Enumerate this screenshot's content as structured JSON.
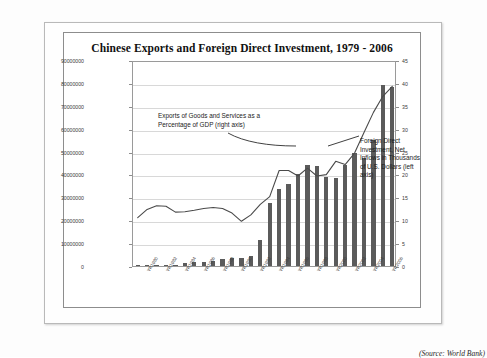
{
  "chart_data": {
    "type": "bar",
    "title": "Chinese Exports and Foreign Direct Investment, 1979 - 2006",
    "xlabel": "",
    "ylabel": "",
    "grid": true,
    "legend_position": "inline-annotations",
    "categories": [
      "YR1979",
      "YR1980",
      "YR1981",
      "YR1982",
      "YR1983",
      "YR1984",
      "YR1985",
      "YR1986",
      "YR1987",
      "YR1988",
      "YR1989",
      "YR1990",
      "YR1991",
      "YR1992",
      "YR1993",
      "YR1994",
      "YR1995",
      "YR1996",
      "YR1997",
      "YR1998",
      "YR1999",
      "YR2000",
      "YR2001",
      "YR2002",
      "YR2003",
      "YR2004",
      "YR2005",
      "YR2006"
    ],
    "xtick_labels": [
      "YR1980",
      "YR1982",
      "YR1984",
      "YR1986",
      "YR1988",
      "YR1990",
      "YR1992",
      "YR1994",
      "YR1996",
      "YR1998",
      "YR2000",
      "YR2002",
      "YR2004",
      "YR2006"
    ],
    "left_axis": {
      "label": "Foreign Direct Investment, Net Inflows in Thousands of U.S. Dollars",
      "ylim": [
        0,
        90000000
      ],
      "ticks": [
        0,
        10000000,
        20000000,
        30000000,
        40000000,
        50000000,
        60000000,
        70000000,
        80000000,
        90000000
      ],
      "tick_labels": [
        "0",
        "10000000",
        "20000000",
        "30000000",
        "40000000",
        "50000000",
        "60000000",
        "70000000",
        "80000000",
        "90000000"
      ]
    },
    "right_axis": {
      "label": "Exports of Goods and Services as a Percentage of GDP",
      "ylim": [
        0,
        45
      ],
      "ticks": [
        0,
        5,
        10,
        15,
        20,
        25,
        30,
        35,
        40,
        45
      ],
      "tick_labels": [
        "0",
        "5",
        "10",
        "15",
        "20",
        "25",
        "30",
        "35",
        "40",
        "45"
      ]
    },
    "series": [
      {
        "name": "Foreign Direct Investment, Net Inflows in Thousands of U.S. Dollars",
        "type": "bar",
        "axis": "left",
        "color": "#5b5b5b",
        "values": [
          8000,
          57000,
          265000,
          430000,
          636000,
          1258000,
          1659000,
          1875000,
          2314000,
          3194000,
          3393000,
          3487000,
          4366000,
          11156000,
          27515000,
          33787000,
          35849000,
          40180000,
          44237000,
          43751000,
          38753000,
          38399000,
          44241000,
          49308000,
          47077000,
          54936000,
          79127000,
          78095000
        ]
      },
      {
        "name": "Exports of Goods and Services as a Percentage of GDP",
        "type": "line",
        "axis": "right",
        "color": "#4a4a4a",
        "values": [
          11.0,
          12.8,
          13.6,
          13.5,
          12.2,
          12.3,
          12.6,
          13.0,
          13.2,
          13.0,
          12.0,
          10.2,
          11.6,
          13.9,
          15.6,
          21.3,
          21.3,
          20.1,
          21.8,
          20.1,
          20.4,
          23.3,
          22.6,
          25.1,
          29.6,
          34.0,
          37.5,
          39.7
        ]
      }
    ],
    "annotations": [
      {
        "name": "exports-annotation",
        "text": "Exports of Goods and Services as a Percentage of GDP (right axis)"
      },
      {
        "name": "fdi-annotation",
        "text": "Foreign Direct Investment, Net Inflows in Thousands of U.S. Dollars (left axis)"
      }
    ],
    "source_note": "(Source: World Bank)"
  }
}
